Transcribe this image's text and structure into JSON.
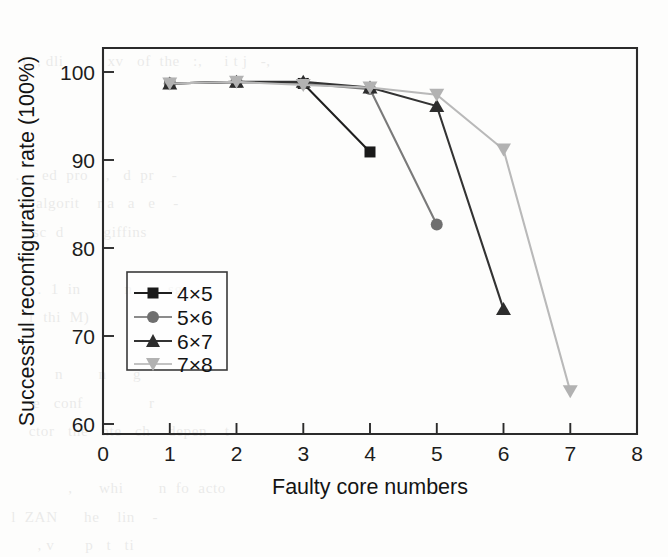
{
  "figure": {
    "kind": "scanned-journal-figure",
    "background_note": "faint bleed-through text from reverse page"
  },
  "chart_data": {
    "type": "line",
    "title": "",
    "xlabel": "Faulty core numbers",
    "ylabel": "Successful reconfiguration rate (100%)",
    "xlim": [
      0,
      8
    ],
    "ylim": [
      56.5,
      104.4
    ],
    "xticks": [
      0,
      1,
      2,
      3,
      4,
      5,
      6,
      7,
      8
    ],
    "xticklabels": [
      "0",
      "1",
      "2",
      "3",
      "4",
      "5",
      "6",
      "7",
      "8"
    ],
    "yticks": [
      60,
      70,
      80,
      90,
      100
    ],
    "yticklabels": [
      "60",
      "70",
      "80",
      "90",
      "100"
    ],
    "grid": false,
    "legend_position": "lower-left-inside",
    "series": [
      {
        "name": "4×5",
        "marker": "square",
        "color": "#1a1a1a",
        "line_color": "#1f1f1f",
        "x": [
          1,
          2,
          3,
          4
        ],
        "values": [
          100.0,
          100.2,
          100.0,
          91.5
        ]
      },
      {
        "name": "5×6",
        "marker": "circle",
        "color": "#6f6f6f",
        "line_color": "#7a7a7a",
        "x": [
          1,
          2,
          3,
          4,
          5
        ],
        "values": [
          100.0,
          100.2,
          100.0,
          99.3,
          82.5
        ]
      },
      {
        "name": "6×7",
        "marker": "triangle-up",
        "color": "#2d2d2d",
        "line_color": "#333333",
        "x": [
          1,
          2,
          3,
          4,
          5,
          6
        ],
        "values": [
          100.0,
          100.2,
          100.2,
          99.5,
          97.2,
          72.0
        ]
      },
      {
        "name": "7×8",
        "marker": "triangle-down",
        "color": "#b2b2b2",
        "line_color": "#b9b9b9",
        "x": [
          1,
          2,
          3,
          4,
          5,
          6,
          7
        ],
        "values": [
          100.0,
          100.2,
          99.8,
          99.5,
          98.6,
          91.8,
          61.8
        ]
      }
    ]
  },
  "legend": {
    "entries": [
      "4×5",
      "5×6",
      "6×7",
      "7×8"
    ]
  },
  "bleed_text": [
    "",
    "   1  , dli          xv   of  the   :,     i t j   -,",
    "",
    "",
    "",
    "  .  ,  ed  pro    ,   d  pr    -",
    "   w algorit    r a   a   e    -",
    "   .  sc  d         giffins",
    "",
    "       .  1  in          n        sg",
    "     f  thi  M)",
    "",
    "           n        n      g",
    "      e   conf               r",
    "     ctor   the   nte   ch    depen    t",
    "",
    "              ,      whi        n  fo  acto",
    " l  ZAN      he    lin    -       ",
    "       , v       p   t   ti"
  ]
}
